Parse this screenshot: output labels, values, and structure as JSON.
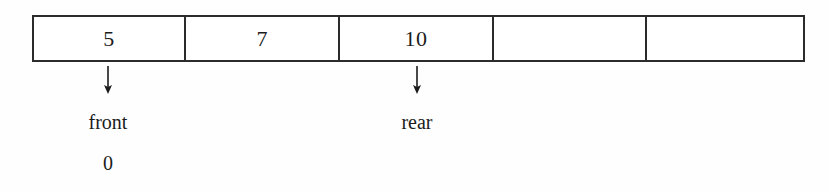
{
  "figure": {
    "array": {
      "cells": [
        {
          "value": "5",
          "filled": true,
          "width_px": 153
        },
        {
          "value": "7",
          "filled": true,
          "width_px": 155
        },
        {
          "value": "10",
          "filled": true,
          "width_px": 154
        },
        {
          "value": "",
          "filled": false,
          "width_px": 154
        },
        {
          "value": "",
          "filled": false,
          "width_px": 157
        }
      ],
      "border_color": "#2b2b2b",
      "fill_color": "#ffffff"
    },
    "pointers": [
      {
        "name": "front",
        "label": "front",
        "index": "0",
        "arrow": "down-arrow",
        "x_px": 108
      },
      {
        "name": "rear",
        "label": "rear",
        "index": "",
        "arrow": "down-arrow",
        "x_px": 417
      }
    ]
  }
}
